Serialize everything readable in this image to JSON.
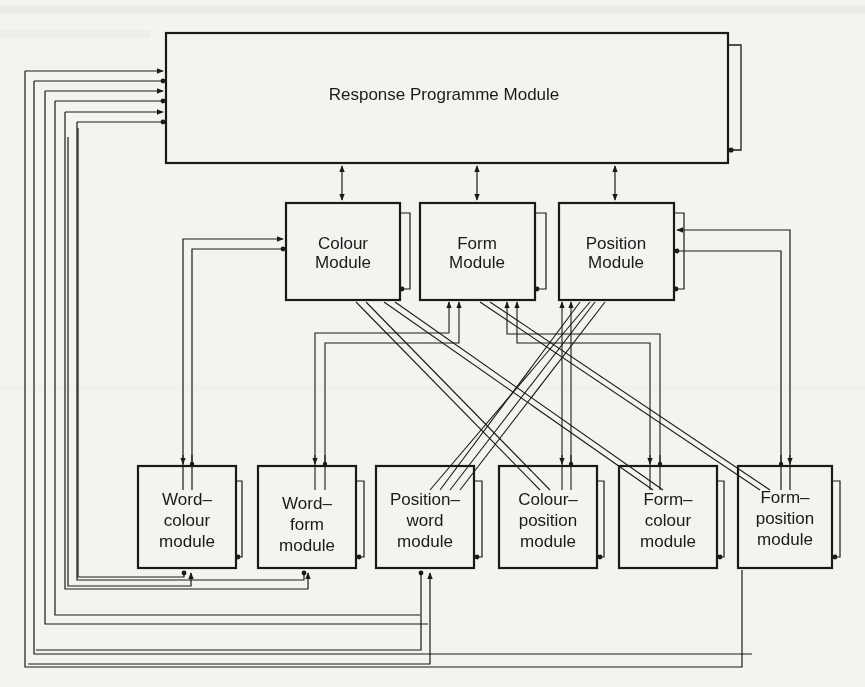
{
  "diagram": {
    "title_module": "Response Programme Module",
    "primary_modules": [
      {
        "id": "colour",
        "line1": "Colour",
        "line2": "Module"
      },
      {
        "id": "form",
        "line1": "Form",
        "line2": "Module"
      },
      {
        "id": "position",
        "line1": "Position",
        "line2": "Module"
      }
    ],
    "conjunction_modules": [
      {
        "id": "word-colour",
        "line1": "Word–",
        "line2": "colour",
        "line3": "module"
      },
      {
        "id": "word-form",
        "line1": "Word–",
        "line2": "form",
        "line3": "module"
      },
      {
        "id": "position-word",
        "line1": "Position–",
        "line2": "word",
        "line3": "module"
      },
      {
        "id": "colour-position",
        "line1": "Colour–",
        "line2": "position",
        "line3": "module"
      },
      {
        "id": "form-colour",
        "line1": "Form–",
        "line2": "colour",
        "line3": "module"
      },
      {
        "id": "form-position",
        "line1": "Form–",
        "line2": "position",
        "line3": "module"
      }
    ]
  },
  "colors": {
    "ink": "#1a1a1a",
    "paper": "#f4f3f0",
    "bleed_text": "#b9b7b1"
  }
}
